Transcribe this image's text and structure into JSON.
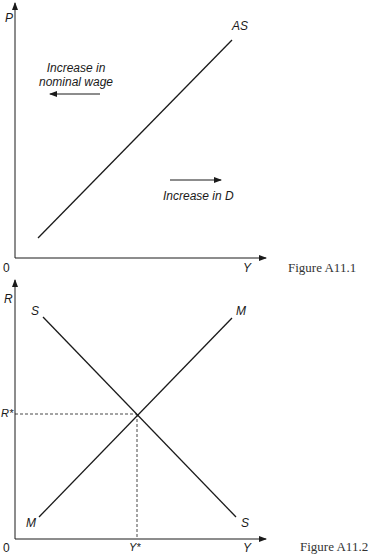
{
  "figure1": {
    "caption": "Figure A11.1",
    "y_axis_label": "P",
    "x_axis_label": "Y",
    "origin_label": "0",
    "curve_label": "AS",
    "annotation_left": "Increase in nominal wage",
    "annotation_left_line1": "Increase in",
    "annotation_left_line2": "nominal wage",
    "annotation_right": "Increase in D"
  },
  "figure2": {
    "caption": "Figure A11.2",
    "y_axis_label": "R",
    "x_axis_label": "Y",
    "origin_label": "0",
    "s_curve_top_label": "S",
    "s_curve_bottom_label": "S",
    "m_curve_top_label": "M",
    "m_curve_bottom_label": "M",
    "equilibrium_r_label": "R*",
    "equilibrium_y_label": "Y*"
  },
  "colors": {
    "line": "#1a1a1a",
    "background": "#ffffff"
  }
}
